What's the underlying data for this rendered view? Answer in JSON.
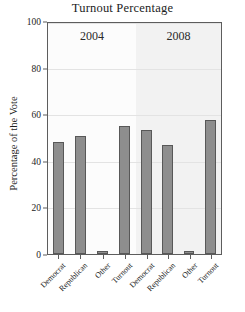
{
  "chart_data": {
    "type": "bar",
    "title": "Turnout Percentage",
    "xlabel": "",
    "ylabel": "Percentage of the Vote",
    "ylim": [
      0,
      100
    ],
    "yticks": [
      0,
      20,
      40,
      60,
      80,
      100
    ],
    "yticklabels": [
      "0",
      "20",
      "40",
      "60",
      "80",
      "100"
    ],
    "grid": true,
    "legend": "none",
    "panels": [
      {
        "label": "2004",
        "categories": [
          "Democrat",
          "Republican",
          "Other",
          "Turnout"
        ],
        "values": [
          48.3,
          51.0,
          1.2,
          55.5
        ]
      },
      {
        "label": "2008",
        "categories": [
          "Democrat",
          "Republican",
          "Other",
          "Turnout"
        ],
        "values": [
          53.6,
          47.4,
          1.5,
          58.0
        ]
      }
    ],
    "colors": {
      "bar_fill": "#8e8e8e",
      "bar_edge": "#585858",
      "panel_2004_bg": "#fcfcfc",
      "panel_2008_bg": "#f2f2f2",
      "gridline": "#e3e3e3",
      "frame": "#5d5d5d",
      "text": "#1d1d1d",
      "figure_bg": "#ffffff"
    }
  }
}
